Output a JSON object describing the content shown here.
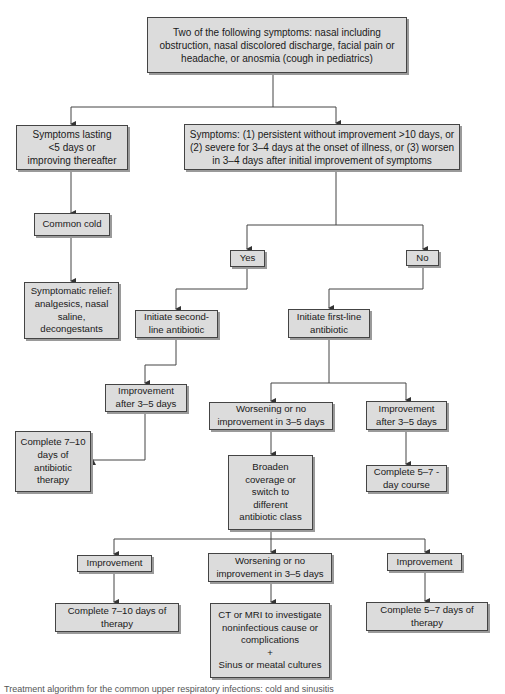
{
  "nodes": {
    "root": "Two of the following symptoms: nasal including obstruction, nasal discolored discharge, facial pain or headache, or anosmia (cough in pediatrics)",
    "short_symptoms": "Symptoms lasting <5 days or improving thereafter",
    "persistent_symptoms": "Symptoms: (1) persistent without improvement >10 days, or (2) severe for 3–4 days at the onset of illness, or (3) worsen in 3–4 days after initial improvement of symptoms",
    "common_cold": "Common cold",
    "symptomatic_relief": "Symptomatic relief: analgesics, nasal saline, decongestants",
    "yes": "Yes",
    "no": "No",
    "second_line": "Initiate second-line antibiotic",
    "first_line": "Initiate first-line antibiotic",
    "improvement_left": "Improvement after 3–5 days",
    "complete_7_10_antibiotic": "Complete 7–10 days of antibiotic therapy",
    "worsening_mid": "Worsening or no improvement in 3–5 days",
    "improvement_right": "Improvement after 3–5 days",
    "complete_5_7_course": "Complete 5–7 -day course",
    "broaden": "Broaden coverage or switch to different antibiotic class",
    "improvement_bottom_left": "Improvement",
    "worsening_bottom": "Worsening or no improvement in 3–5 days",
    "improvement_bottom_right": "Improvement",
    "complete_7_10_therapy": "Complete 7–10 days of therapy",
    "ct_mri": "CT or MRI to investigate noninfectious cause or complications",
    "plus": "+",
    "cultures": "Sinus or meatal cultures",
    "complete_5_7_therapy": "Complete 5–7 days of therapy"
  },
  "caption": "Treatment algorithm for the common upper respiratory infections: cold and sinusitis",
  "colors": {
    "box_fill": "#dcdcdc",
    "box_border": "#444444",
    "shadow": "#9a9a9a",
    "line": "#444444"
  }
}
